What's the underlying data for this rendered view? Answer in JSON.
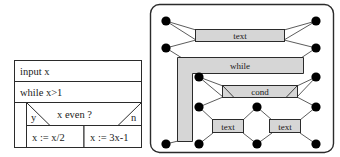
{
  "figure": {
    "background": "#ffffff",
    "line_color": "#2b2b2b",
    "box_fill": "#d6d6d6",
    "node_fill": "#000000",
    "panels": [
      {
        "id": "structogram",
        "kind": "nassi-shneiderman-diagram"
      },
      {
        "id": "graph",
        "kind": "rounded-frame-graph"
      }
    ]
  },
  "structogram": {
    "rows": {
      "input": "input x",
      "while": "while x>1",
      "condition": "x even ?",
      "yes_label": "y",
      "no_label": "n",
      "yes_branch": "x := x/2",
      "no_branch": "x := 3x-1"
    }
  },
  "graph": {
    "boxes": {
      "top": "text",
      "while": "while",
      "cond": "cond",
      "left_leaf": "text",
      "right_leaf": "text"
    },
    "node_count": 14
  }
}
